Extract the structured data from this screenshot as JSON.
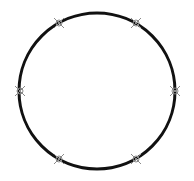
{
  "diagram": {
    "shape": "circle",
    "center": [
      97,
      91
    ],
    "radius": 78,
    "stroke_color": "#111111",
    "stroke_width": 3,
    "marker_color": "#8a8a8a",
    "marker_style": "x-cross-with-ring",
    "markers": [
      {
        "label": "marker-top-left",
        "x": 59,
        "y": 23
      },
      {
        "label": "marker-top-right",
        "x": 136,
        "y": 23
      },
      {
        "label": "marker-left",
        "x": 20,
        "y": 91
      },
      {
        "label": "marker-right",
        "x": 175,
        "y": 91
      },
      {
        "label": "marker-bottom-left",
        "x": 59,
        "y": 159
      },
      {
        "label": "marker-bottom-right",
        "x": 136,
        "y": 159
      }
    ]
  }
}
